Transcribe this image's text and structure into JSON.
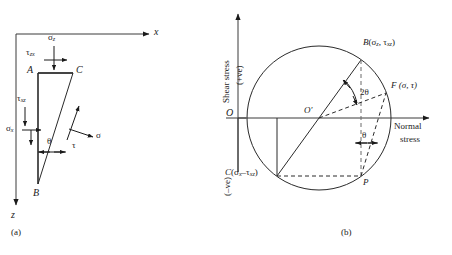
{
  "figure": {
    "panel_a": {
      "caption": "(a)",
      "axis_x_label": "x",
      "axis_z_label": "z",
      "vertices": {
        "A": "A",
        "B": "B",
        "C": "C"
      },
      "stresses": {
        "sigma_z": "σ",
        "sigma_z_sub": "z",
        "tau_zx": "τ",
        "tau_zx_sub": "zx",
        "sigma_x": "σ",
        "sigma_x_sub": "x",
        "tau_xz": "τ",
        "tau_xz_sub": "xz",
        "sigma_n": "σ",
        "tau_n": "τ",
        "theta": "θ"
      }
    },
    "panel_b": {
      "caption": "(b)",
      "y_axis_title": "Shear stress",
      "y_axis_positive": "(+ve)",
      "y_axis_negative": "(–ve)",
      "x_axis_title_line1": "Normal",
      "x_axis_title_line2": "stress",
      "origin_label": "O",
      "center_label": "O′",
      "point_B_name": "B",
      "point_B_coords_open": "(",
      "point_B_sigma": "σ",
      "point_B_sigma_sub": "z",
      "point_B_comma": ", ",
      "point_B_tau": "τ",
      "point_B_tau_sub": "xz",
      "point_B_coords_close": ")",
      "point_C_name": "C",
      "point_C_sigma": "σ",
      "point_C_sigma_sub": "x",
      "point_C_minus": "–",
      "point_C_tau": "τ",
      "point_C_tau_sub": "xz",
      "point_F_label": "F (σ, τ)",
      "point_P_label": "P",
      "angle_2theta": "2θ",
      "angle_theta": "θ"
    }
  }
}
